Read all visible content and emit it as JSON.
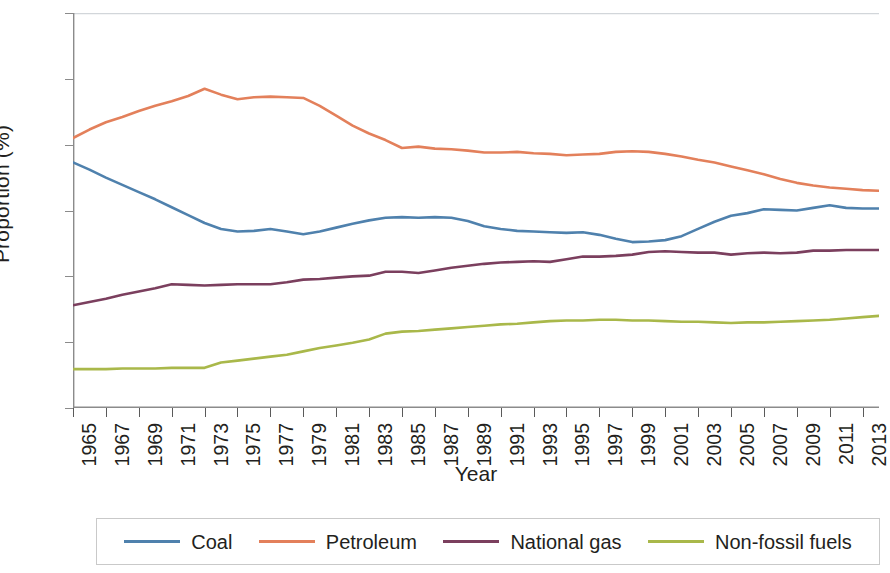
{
  "chart_data": {
    "type": "line",
    "title": "",
    "xlabel": "Year",
    "ylabel": "Proportion (%)",
    "xlim": [
      1965,
      2014
    ],
    "ylim": [
      0,
      60
    ],
    "ytick_labels": [
      "0",
      "10",
      "20",
      "30",
      "40",
      "50",
      "60"
    ],
    "ytick_values": [
      0,
      10,
      20,
      30,
      40,
      50,
      60
    ],
    "xtick_labels": [
      "1965",
      "1967",
      "1969",
      "1971",
      "1973",
      "1975",
      "1977",
      "1979",
      "1981",
      "1983",
      "1985",
      "1987",
      "1989",
      "1991",
      "1993",
      "1995",
      "1997",
      "1999",
      "2001",
      "2003",
      "2005",
      "2007",
      "2009",
      "2011",
      "2013"
    ],
    "xtick_values": [
      1965,
      1967,
      1969,
      1971,
      1973,
      1975,
      1977,
      1979,
      1981,
      1983,
      1985,
      1987,
      1989,
      1991,
      1993,
      1995,
      1997,
      1999,
      2001,
      2003,
      2005,
      2007,
      2009,
      2011,
      2013
    ],
    "grid": false,
    "legend_position": "bottom",
    "x": [
      1965,
      1966,
      1967,
      1968,
      1969,
      1970,
      1971,
      1972,
      1973,
      1974,
      1975,
      1976,
      1977,
      1978,
      1979,
      1980,
      1981,
      1982,
      1983,
      1984,
      1985,
      1986,
      1987,
      1988,
      1989,
      1990,
      1991,
      1992,
      1993,
      1994,
      1995,
      1996,
      1997,
      1998,
      1999,
      2000,
      2001,
      2002,
      2003,
      2004,
      2005,
      2006,
      2007,
      2008,
      2009,
      2010,
      2011,
      2012,
      2013,
      2014
    ],
    "series": [
      {
        "name": "Coal",
        "color": "#4f81ad",
        "values": [
          37.3,
          36.2,
          35.0,
          33.9,
          32.8,
          31.7,
          30.5,
          29.3,
          28.1,
          27.2,
          26.8,
          26.9,
          27.2,
          26.8,
          26.4,
          26.8,
          27.4,
          28.0,
          28.5,
          28.9,
          29.0,
          28.9,
          29.0,
          28.9,
          28.4,
          27.6,
          27.2,
          26.9,
          26.8,
          26.7,
          26.6,
          26.7,
          26.3,
          25.7,
          25.2,
          25.3,
          25.5,
          26.1,
          27.2,
          28.3,
          29.2,
          29.6,
          30.2,
          30.1,
          30.0,
          30.4,
          30.8,
          30.4,
          30.3,
          30.3
        ]
      },
      {
        "name": "Petroleum",
        "color": "#e3805b",
        "values": [
          41.0,
          42.3,
          43.4,
          44.2,
          45.1,
          45.9,
          46.6,
          47.4,
          48.5,
          47.6,
          46.9,
          47.2,
          47.3,
          47.2,
          47.1,
          45.9,
          44.4,
          42.9,
          41.7,
          40.7,
          39.5,
          39.7,
          39.4,
          39.3,
          39.1,
          38.8,
          38.8,
          38.9,
          38.7,
          38.6,
          38.4,
          38.5,
          38.6,
          38.9,
          39.0,
          38.9,
          38.6,
          38.2,
          37.7,
          37.3,
          36.7,
          36.1,
          35.5,
          34.8,
          34.2,
          33.8,
          33.5,
          33.3,
          33.1,
          33.0
        ]
      },
      {
        "name": "National gas",
        "color": "#7b3f5e",
        "values": [
          15.6,
          16.1,
          16.6,
          17.2,
          17.7,
          18.2,
          18.8,
          18.7,
          18.6,
          18.7,
          18.8,
          18.8,
          18.8,
          19.1,
          19.5,
          19.6,
          19.8,
          20.0,
          20.1,
          20.7,
          20.7,
          20.5,
          20.9,
          21.3,
          21.6,
          21.9,
          22.1,
          22.2,
          22.3,
          22.2,
          22.6,
          23.0,
          23.0,
          23.1,
          23.3,
          23.7,
          23.8,
          23.7,
          23.6,
          23.6,
          23.3,
          23.5,
          23.6,
          23.5,
          23.6,
          23.9,
          23.9,
          24.0,
          24.0,
          24.0
        ]
      },
      {
        "name": "Non-fossil fuels",
        "color": "#a9b84a",
        "values": [
          5.9,
          5.9,
          5.9,
          6.0,
          6.0,
          6.0,
          6.1,
          6.1,
          6.1,
          6.9,
          7.2,
          7.5,
          7.8,
          8.1,
          8.6,
          9.1,
          9.5,
          9.9,
          10.4,
          11.3,
          11.6,
          11.7,
          11.9,
          12.1,
          12.3,
          12.5,
          12.7,
          12.8,
          13.0,
          13.2,
          13.3,
          13.3,
          13.4,
          13.4,
          13.3,
          13.3,
          13.2,
          13.1,
          13.1,
          13.0,
          12.9,
          13.0,
          13.0,
          13.1,
          13.2,
          13.3,
          13.4,
          13.6,
          13.8,
          14.0
        ]
      }
    ]
  },
  "axes": {
    "y_label": "Proportion (%)",
    "x_label": "Year"
  },
  "legend": {
    "items": [
      {
        "label": "Coal",
        "color": "#4f81ad"
      },
      {
        "label": "Petroleum",
        "color": "#e3805b"
      },
      {
        "label": "National gas",
        "color": "#7b3f5e"
      },
      {
        "label": "Non-fossil fuels",
        "color": "#a9b84a"
      }
    ]
  }
}
